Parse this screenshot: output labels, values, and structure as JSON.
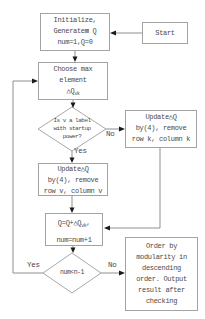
{
  "flowchart": {
    "start": {
      "label": "Start"
    },
    "init": {
      "line1": "Initialize,",
      "line2": "Generate⊠ Q",
      "line3": "num=1,Q=0"
    },
    "choose": {
      "line1": "Choose max",
      "line2": "element",
      "line3_main": "△Q",
      "line3_sub": "vk"
    },
    "decision_label": {
      "line1": "Is v a label",
      "line2": "with startup",
      "line3": "power?"
    },
    "update_k": {
      "line1": "Update△Q",
      "line2": "by(4), remove",
      "line3": "row k, column k"
    },
    "update_v": {
      "line1": "Update△Q",
      "line2": "by(4), remove",
      "line3": "row v, column v"
    },
    "accumulate": {
      "line1_main": "Q=Q+△Q",
      "line1_sub": "vk",
      "line1_tail": ",",
      "line2": "num=num+1"
    },
    "decision_num": {
      "label": "num<n-1"
    },
    "output": {
      "line1": "Order by",
      "line2": "modularity in",
      "line3": "descending",
      "line4": "order. Output",
      "line5": "result after",
      "line6": "checking"
    },
    "edge_labels": {
      "yes1": "Yes",
      "no1": "No",
      "yes2": "Yes",
      "no2": "No"
    }
  },
  "colors": {
    "background": "#ffffff",
    "box_border": "#a3a3a3",
    "connector": "#8f8f8f",
    "arrowhead": "#1a1a1a",
    "text": "#4a4a4a"
  }
}
